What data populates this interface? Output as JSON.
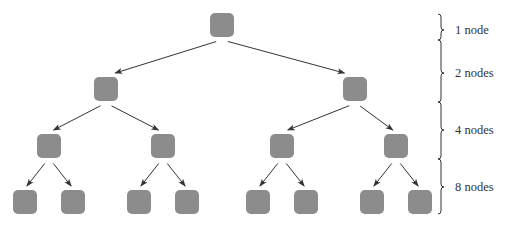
{
  "diagram": {
    "type": "binary-tree",
    "colors": {
      "node": "#8c8c8c",
      "edge": "#333333",
      "brace": "#333333",
      "label": "#333333",
      "background": "#ffffff"
    },
    "node_size": 24,
    "levels": [
      {
        "label": "1 node",
        "y": 25,
        "xs": [
          222
        ],
        "brace_tip_y": 30
      },
      {
        "label": "2 nodes",
        "y": 89,
        "xs": [
          106,
          355
        ],
        "brace_tip_y": 73
      },
      {
        "label": "4 nodes",
        "y": 146,
        "xs": [
          49,
          163,
          282,
          396
        ],
        "brace_tip_y": 130
      },
      {
        "label": "8 nodes",
        "y": 202,
        "xs": [
          25,
          73,
          139,
          187,
          258,
          306,
          372,
          420
        ],
        "brace_tip_y": 187
      }
    ],
    "brace": {
      "x": 441,
      "top": 14,
      "bottom": 214,
      "joints": [
        40,
        102,
        159
      ]
    }
  }
}
